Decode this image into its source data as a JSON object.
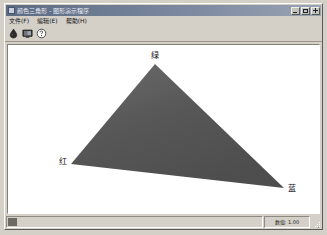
{
  "window": {
    "title": "颜色三角形 - 图形演示程序",
    "icon": "app-icon",
    "controls": {
      "minimize": "最小化",
      "maximize": "最大化",
      "close": "关闭"
    }
  },
  "menubar": {
    "items": [
      {
        "label": "文件(F)",
        "name": "menu-file"
      },
      {
        "label": "编辑(E)",
        "name": "menu-edit"
      },
      {
        "label": "帮助(H)",
        "name": "menu-help"
      }
    ]
  },
  "toolbar": {
    "buttons": [
      {
        "icon": "color-droplet-icon",
        "tooltip": "颜色"
      },
      {
        "icon": "display-monitor-icon",
        "tooltip": "显示"
      },
      {
        "icon": "help-circle-icon",
        "tooltip": "帮助"
      }
    ]
  },
  "canvas": {
    "background": "#ffffff",
    "triangle": {
      "name": "rgb-color-triangle",
      "fill": "#5a5a5a",
      "vertices": [
        {
          "label": "绿",
          "name": "vertex-green",
          "x": 152,
          "y": 62,
          "color": "#00c000"
        },
        {
          "label": "红",
          "name": "vertex-red",
          "x": 68,
          "y": 162,
          "color": "#c00000"
        },
        {
          "label": "蓝",
          "name": "vertex-blue",
          "x": 281,
          "y": 186,
          "color": "#0000c0"
        }
      ]
    }
  },
  "statusbar": {
    "left_text": "",
    "right_text": "数值: 1.00"
  }
}
